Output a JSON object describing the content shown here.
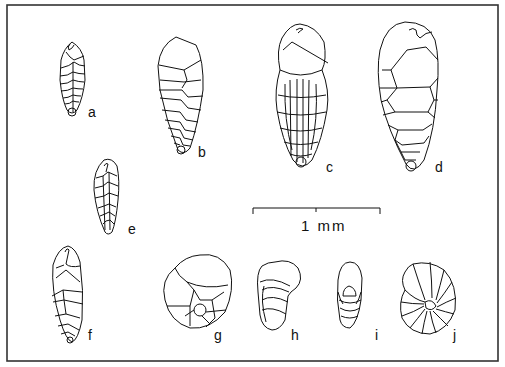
{
  "figure": {
    "type": "foraminifera specimen plate",
    "border_color": "#333333",
    "line_color": "#111111"
  },
  "specimens": [
    {
      "id": "a",
      "label": "a",
      "form": "biserial elongate, small"
    },
    {
      "id": "b",
      "label": "b",
      "form": "biserial tapering"
    },
    {
      "id": "c",
      "label": "c",
      "form": "biserial costate"
    },
    {
      "id": "d",
      "label": "d",
      "form": "biserial inflated"
    },
    {
      "id": "e",
      "label": "e",
      "form": "biserial small tapering"
    },
    {
      "id": "f",
      "label": "f",
      "form": "biserial elongate"
    },
    {
      "id": "g",
      "label": "g",
      "form": "trochospiral umbilical view"
    },
    {
      "id": "h",
      "label": "h",
      "form": "planispiral edge view"
    },
    {
      "id": "i",
      "label": "i",
      "form": "planispiral apertural view"
    },
    {
      "id": "j",
      "label": "j",
      "form": "planispiral side view"
    }
  ],
  "scale_bar": {
    "label": "1 mm"
  }
}
